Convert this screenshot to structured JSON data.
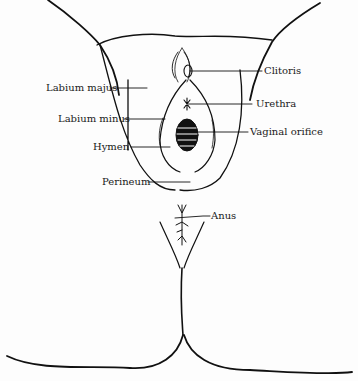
{
  "diagram": {
    "type": "anatomical line drawing",
    "labels": {
      "clitoris": "Clitoris",
      "labium_majus": "Labium majus",
      "urethra": "Urethra",
      "labium_minus": "Labium minus",
      "vaginal_orifice": "Vaginal orifice",
      "hymen": "Hymen",
      "perineum": "Perineum",
      "anus": "Anus"
    },
    "colors": {
      "line": "#111111",
      "background": "#fdfdfd"
    }
  }
}
